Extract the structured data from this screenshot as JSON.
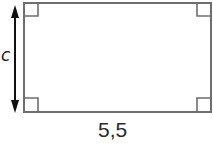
{
  "diagram": {
    "shape": "rectangle",
    "colors": {
      "outline": "#6e6e6e",
      "arrow": "#111111",
      "background": "#ffffff"
    },
    "right_angle_markers": 4,
    "labels": {
      "height": "c",
      "width": "5,5"
    }
  }
}
